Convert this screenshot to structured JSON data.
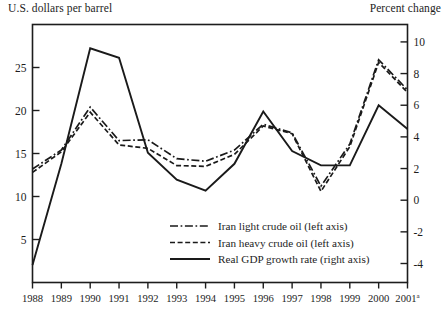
{
  "figure": {
    "left_axis_caption": "U.S. dollars per barrel",
    "right_axis_caption": "Percent change"
  },
  "chart_data": {
    "type": "line",
    "title": "",
    "xlabel": "",
    "ylabel": "U.S. dollars per barrel",
    "y2label": "Percent change",
    "grid": false,
    "legend_position": "inside-bottom-center",
    "x": [
      "1988",
      "1989",
      "1990",
      "1991",
      "1992",
      "1993",
      "1994",
      "1995",
      "1996",
      "1997",
      "1998",
      "1999",
      "2000",
      "2001"
    ],
    "x_last_superscript": "a",
    "xtick_labels": [
      "1988",
      "1989",
      "1990",
      "1991",
      "1992",
      "1993",
      "1994",
      "1995",
      "1996",
      "1997",
      "1998",
      "1999",
      "2000",
      "2001"
    ],
    "ylim": [
      0,
      30
    ],
    "ytick_labels": [
      "5",
      "10",
      "15",
      "20",
      "25"
    ],
    "yticks": [
      5,
      10,
      15,
      20,
      25
    ],
    "y2lim": [
      -5.2,
      11.1
    ],
    "y2tick_labels": [
      "10",
      "8",
      "6",
      "4",
      "2",
      "0",
      "-2",
      "-4"
    ],
    "y2ticks": [
      10,
      8,
      6,
      4,
      2,
      0,
      -2,
      -4
    ],
    "series": [
      {
        "name": "Iran light crude oil (left axis)",
        "axis": "left",
        "style": "dash-dot",
        "values": [
          13.2,
          15.4,
          20.4,
          16.5,
          16.6,
          14.4,
          14.1,
          15.4,
          18.4,
          17.4,
          11.2,
          16.1,
          25.9,
          22.4
        ]
      },
      {
        "name": "Iran heavy crude oil (left axis)",
        "axis": "left",
        "style": "dashed",
        "values": [
          12.8,
          15.2,
          19.8,
          16.0,
          15.6,
          13.6,
          13.5,
          14.9,
          18.2,
          17.3,
          10.6,
          15.8,
          25.6,
          22.1
        ]
      },
      {
        "name": "Real GDP growth rate (right axis)",
        "axis": "right",
        "style": "solid",
        "values": [
          -4.1,
          2.3,
          9.6,
          9.0,
          3.0,
          1.3,
          0.6,
          2.3,
          5.6,
          3.1,
          2.2,
          2.2,
          6.0,
          4.5
        ]
      }
    ],
    "legend": [
      {
        "label": "Iran light crude oil (left axis)",
        "style": "dash-dot"
      },
      {
        "label": "Iran heavy crude oil (left axis)",
        "style": "dashed"
      },
      {
        "label": "Real GDP growth rate (right axis)",
        "style": "solid"
      }
    ]
  }
}
